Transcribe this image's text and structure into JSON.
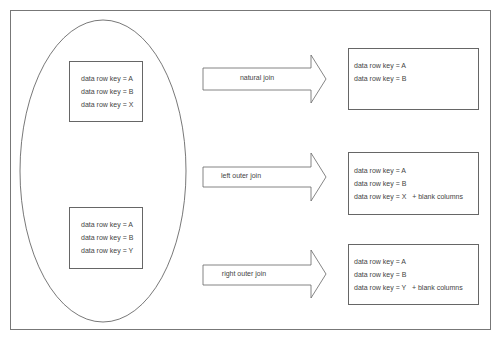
{
  "diagram": {
    "type": "sql-join-illustration",
    "source_tables": [
      {
        "rows": [
          "data row key = A",
          "data row key = B",
          "data row key = X"
        ]
      },
      {
        "rows": [
          "data row key = A",
          "data row key = B",
          "data row key = Y"
        ]
      }
    ],
    "joins": [
      {
        "label": "natural join",
        "result_rows": [
          "data row key = A",
          "data row key = B"
        ]
      },
      {
        "label": "left outer join",
        "result_rows": [
          "data row key = A",
          "data row key = B",
          "data row key = X   + blank columns"
        ]
      },
      {
        "label": "right outer join",
        "result_rows": [
          "data row key = A",
          "data row key = B",
          "data row key = Y   + blank columns"
        ]
      }
    ]
  }
}
